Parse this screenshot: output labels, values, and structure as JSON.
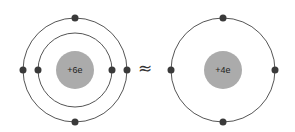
{
  "colors": {
    "orbit": "#555555",
    "electron": "#3a3a3a",
    "nucleus": "#ababab",
    "text": "#222222"
  },
  "left_atom": {
    "nucleus_label": "+6e",
    "shells": 2,
    "electrons": 6
  },
  "relation_symbol": "≈",
  "right_atom": {
    "nucleus_label": "+4e",
    "shells": 1,
    "electrons": 4
  }
}
